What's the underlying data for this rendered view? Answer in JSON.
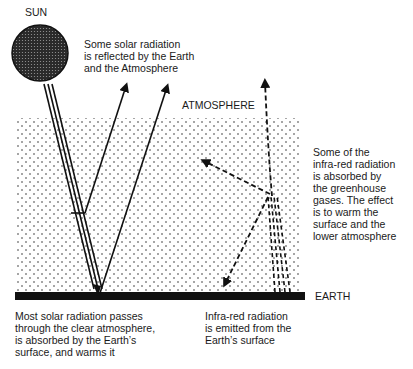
{
  "diagram": {
    "labels": {
      "sun": "SUN",
      "atmosphere": "ATMOSPHERE",
      "earth": "EARTH",
      "reflected": "Some solar radiation\nis reflected by the Earth\nand the Atmosphere",
      "absorbed_ir": "Some of the\ninfra-red radiation\nis absorbed by\nthe greenhouse\ngases. The effect\nis to warm the\nsurface and the\nlower atmosphere",
      "solar_passes": "Most solar radiation passes\nthrough the clear atmosphere,\nis absorbed by the Earth’s\nsurface, and warms it",
      "ir_emitted": "Infra-red radiation\nis emitted from the\nEarth’s surface"
    },
    "nodes": [
      {
        "id": "sun",
        "label": "SUN"
      },
      {
        "id": "atmosphere",
        "label": "ATMOSPHERE"
      },
      {
        "id": "earth",
        "label": "EARTH"
      }
    ],
    "edges": [
      {
        "from": "sun",
        "to": "earth",
        "type": "solar radiation (triple line)"
      },
      {
        "from": "atmosphere",
        "to": "space",
        "type": "reflected solar radiation (solid arrow)"
      },
      {
        "from": "earth",
        "to": "space",
        "type": "reflected solar radiation (solid arrow)"
      },
      {
        "from": "earth",
        "to": "atmosphere",
        "type": "infra-red radiation (dashed arrows)"
      },
      {
        "from": "atmosphere",
        "to": "earth",
        "type": "re-emitted infra-red (dashed arrow)"
      },
      {
        "from": "atmosphere",
        "to": "space",
        "type": "escaping infra-red (dashed arrow)"
      }
    ],
    "colors": {
      "ink": "#111111",
      "background": "#ffffff",
      "sun_fill": "#3a3a3a"
    }
  }
}
